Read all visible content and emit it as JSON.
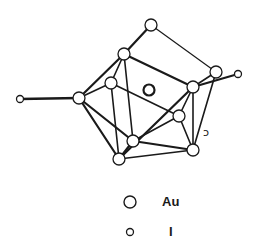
{
  "diagram": {
    "title": "",
    "colors": {
      "ink": "#1a1a1a",
      "atom_fill": "#ffffff",
      "background": "#ffffff"
    },
    "atoms": [
      {
        "id": "Au1",
        "element": "Au",
        "x": 151,
        "y": 25
      },
      {
        "id": "Au2",
        "element": "Au",
        "x": 124,
        "y": 54
      },
      {
        "id": "Au3",
        "element": "Au",
        "x": 79,
        "y": 98
      },
      {
        "id": "Au4",
        "element": "Au",
        "x": 111,
        "y": 83
      },
      {
        "id": "Au5",
        "element": "Au",
        "x": 216,
        "y": 72
      },
      {
        "id": "Au6",
        "element": "Au",
        "x": 193,
        "y": 87
      },
      {
        "id": "Au7",
        "element": "Au",
        "x": 179,
        "y": 116
      },
      {
        "id": "Au8",
        "element": "Au",
        "x": 133,
        "y": 141
      },
      {
        "id": "Au9",
        "element": "Au",
        "x": 119,
        "y": 159
      },
      {
        "id": "Au10",
        "element": "Au",
        "x": 193,
        "y": 150
      },
      {
        "id": "AuC",
        "element": "Au",
        "x": 149,
        "y": 90,
        "central": true
      },
      {
        "id": "I1",
        "element": "I",
        "x": 20,
        "y": 99
      },
      {
        "id": "I2",
        "element": "I",
        "x": 238,
        "y": 74
      }
    ],
    "bonds": [
      [
        "Au1",
        "Au2",
        2.2
      ],
      [
        "Au1",
        "Au5",
        1.2
      ],
      [
        "Au2",
        "Au3",
        2.2
      ],
      [
        "Au2",
        "Au4",
        1.6
      ],
      [
        "Au2",
        "Au6",
        2.2
      ],
      [
        "Au2",
        "Au8",
        1.6
      ],
      [
        "Au3",
        "Au4",
        1.6
      ],
      [
        "Au3",
        "Au8",
        2.2
      ],
      [
        "Au3",
        "Au9",
        2.2
      ],
      [
        "Au3",
        "I1",
        2.4
      ],
      [
        "Au4",
        "Au9",
        1.6
      ],
      [
        "Au4",
        "Au7",
        1.6
      ],
      [
        "Au5",
        "Au6",
        1.6
      ],
      [
        "Au5",
        "Au10",
        1.6
      ],
      [
        "Au6",
        "I2",
        2.0
      ],
      [
        "Au6",
        "Au9",
        2.2
      ],
      [
        "Au6",
        "Au7",
        1.6
      ],
      [
        "Au6",
        "Au10",
        1.6
      ],
      [
        "Au7",
        "Au10",
        1.6
      ],
      [
        "Au7",
        "Au8",
        1.6
      ],
      [
        "Au8",
        "Au9",
        2.2
      ],
      [
        "Au8",
        "Au10",
        2.2
      ],
      [
        "Au9",
        "Au10",
        1.6
      ]
    ],
    "annotation_mark": {
      "text": "ↄ",
      "x": 206,
      "y": 132
    }
  },
  "legend": {
    "items": [
      {
        "symbol": "large-circle",
        "label": "Au"
      },
      {
        "symbol": "small-circle",
        "label": "I"
      }
    ]
  }
}
